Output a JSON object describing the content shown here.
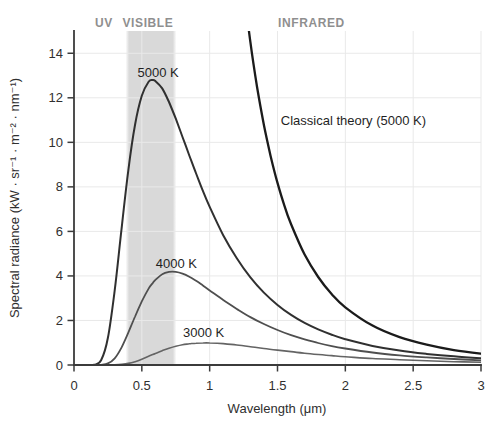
{
  "chart_data": {
    "type": "line",
    "title": "",
    "xlabel": "Wavelength (μm)",
    "ylabel": "Spectral radiance (kW · sr⁻¹ · m⁻² · nm⁻¹)",
    "xlim": [
      0,
      3
    ],
    "ylim": [
      0,
      15
    ],
    "x_ticks": [
      0,
      0.5,
      1,
      1.5,
      2,
      2.5,
      3
    ],
    "x_tick_labels": [
      "0",
      "0.5",
      "1",
      "1.5",
      "2",
      "2.5",
      "3"
    ],
    "y_ticks": [
      0,
      2,
      4,
      6,
      8,
      10,
      12,
      14
    ],
    "y_tick_labels": [
      "0",
      "2",
      "4",
      "6",
      "8",
      "10",
      "12",
      "14"
    ],
    "grid": true,
    "legend_position": "none",
    "background_color": "#ffffff",
    "axis_color": "#3b3b3b",
    "grid_color": "#e9e9e9",
    "visible_band": {
      "x_start": 0.38,
      "x_end": 0.755,
      "color": "#d9d9d9"
    },
    "region_labels": [
      {
        "label": "UV",
        "x": 0.22,
        "color": "#8f8f8f"
      },
      {
        "label": "VISIBLE",
        "x": 0.545,
        "color": "#8f8f8f"
      },
      {
        "label": "INFRARED",
        "x": 1.75,
        "color": "#8f8f8f"
      }
    ],
    "series": [
      {
        "name": "Classical theory (5000 K)",
        "color": "#1b1b1b",
        "width": 2.3,
        "x": [
          1.25,
          1.3,
          1.35,
          1.4,
          1.45,
          1.5,
          1.55,
          1.6,
          1.7,
          1.8,
          1.9,
          2.0,
          2.2,
          2.4,
          2.6,
          2.8,
          3.0
        ],
        "y": [
          16.96,
          14.5,
          12.47,
          10.78,
          9.37,
          8.18,
          7.17,
          6.32,
          4.96,
          3.95,
          3.18,
          2.59,
          1.77,
          1.25,
          0.91,
          0.67,
          0.51
        ],
        "label": {
          "text": "Classical theory (5000 K)",
          "x": 2.06,
          "y": 10.8
        }
      },
      {
        "name": "5000 K",
        "color": "#303030",
        "width": 2.0,
        "x": [
          0.05,
          0.1,
          0.15,
          0.2,
          0.25,
          0.3,
          0.35,
          0.4,
          0.45,
          0.5,
          0.55,
          0.58,
          0.6,
          0.65,
          0.7,
          0.75,
          0.8,
          0.85,
          0.9,
          0.95,
          1.0,
          1.1,
          1.2,
          1.3,
          1.4,
          1.5,
          1.6,
          1.7,
          1.8,
          1.9,
          2.0,
          2.2,
          2.4,
          2.6,
          2.8,
          3.0
        ],
        "y": [
          0,
          0,
          0.01,
          0.21,
          1.22,
          3.35,
          6.09,
          8.73,
          10.8,
          12.09,
          12.72,
          12.8,
          12.75,
          12.42,
          11.81,
          11.06,
          10.24,
          9.41,
          8.6,
          7.82,
          7.1,
          5.83,
          4.79,
          3.94,
          3.25,
          2.7,
          2.25,
          1.89,
          1.6,
          1.36,
          1.16,
          0.86,
          0.65,
          0.5,
          0.39,
          0.3
        ],
        "label": {
          "text": "5000 K",
          "x": 0.62,
          "y": 12.93
        }
      },
      {
        "name": "4000 K",
        "color": "#4f4f4f",
        "width": 1.8,
        "x": [
          0.05,
          0.1,
          0.15,
          0.2,
          0.25,
          0.3,
          0.35,
          0.4,
          0.45,
          0.5,
          0.55,
          0.58,
          0.6,
          0.65,
          0.7,
          0.75,
          0.8,
          0.85,
          0.9,
          0.95,
          1.0,
          1.1,
          1.2,
          1.3,
          1.4,
          1.5,
          1.6,
          1.7,
          1.8,
          1.9,
          2.0,
          2.2,
          2.4,
          2.6,
          2.8,
          3.0
        ],
        "y": [
          0,
          0,
          0,
          0.01,
          0.07,
          0.3,
          0.78,
          1.45,
          2.18,
          2.86,
          3.43,
          3.68,
          3.82,
          4.08,
          4.18,
          4.18,
          4.1,
          3.96,
          3.78,
          3.57,
          3.35,
          2.92,
          2.52,
          2.15,
          1.84,
          1.57,
          1.34,
          1.15,
          0.99,
          0.85,
          0.74,
          0.56,
          0.43,
          0.34,
          0.27,
          0.21
        ],
        "label": {
          "text": "4000 K",
          "x": 0.755,
          "y": 4.36
        }
      },
      {
        "name": "3000 K",
        "color": "#646464",
        "width": 1.6,
        "x": [
          0.05,
          0.1,
          0.15,
          0.2,
          0.25,
          0.3,
          0.35,
          0.4,
          0.45,
          0.5,
          0.55,
          0.58,
          0.6,
          0.65,
          0.7,
          0.75,
          0.8,
          0.85,
          0.9,
          0.95,
          1.0,
          1.1,
          1.2,
          1.3,
          1.4,
          1.5,
          1.6,
          1.7,
          1.8,
          1.9,
          2.0,
          2.2,
          2.4,
          2.6,
          2.8,
          3.0
        ],
        "y": [
          0,
          0,
          0,
          0,
          0,
          0.01,
          0.03,
          0.07,
          0.15,
          0.26,
          0.39,
          0.47,
          0.52,
          0.64,
          0.75,
          0.84,
          0.91,
          0.95,
          0.98,
          0.99,
          0.99,
          0.96,
          0.9,
          0.82,
          0.74,
          0.67,
          0.6,
          0.53,
          0.47,
          0.42,
          0.37,
          0.29,
          0.24,
          0.19,
          0.15,
          0.12
        ],
        "label": {
          "text": "3000 K",
          "x": 0.955,
          "y": 1.26
        }
      }
    ]
  }
}
